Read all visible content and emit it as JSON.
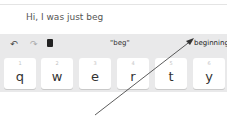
{
  "text_field": {
    "value": "Hi, I was just beg"
  },
  "suggestion_bar": {
    "undo_icon": "↶",
    "redo_icon": "↷",
    "clipboard_icon": "clipboard-icon",
    "suggestions": [
      "\"beg\"",
      "beginning"
    ]
  },
  "keys": [
    {
      "num": "1",
      "char": "q"
    },
    {
      "num": "2",
      "char": "w"
    },
    {
      "num": "3",
      "char": "e"
    },
    {
      "num": "4",
      "char": "r"
    },
    {
      "num": "5",
      "char": "t"
    },
    {
      "num": "6",
      "char": "y"
    }
  ],
  "annotation": {
    "type": "arrow",
    "target": "beginning"
  }
}
